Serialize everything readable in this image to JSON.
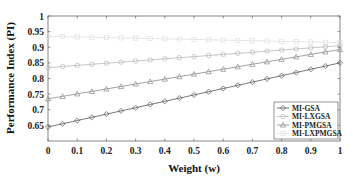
{
  "chart_data": {
    "type": "line",
    "title": "",
    "xlabel": "Weight (w)",
    "ylabel": "Performance Index (PI)",
    "xlim": [
      0,
      1
    ],
    "ylim": [
      0.6,
      1
    ],
    "x_ticks": [
      "0",
      "0.1",
      "0.2",
      "0.3",
      "0.4",
      "0.5",
      "0.6",
      "0.7",
      "0.8",
      "0.9",
      "1"
    ],
    "y_ticks": [
      "0.65",
      "0.7",
      "0.75",
      "0.8",
      "0.85",
      "0.9",
      "0.95",
      "1"
    ],
    "grid": false,
    "legend_position": "lower right",
    "x": [
      0,
      0.05,
      0.1,
      0.15,
      0.2,
      0.25,
      0.3,
      0.35,
      0.4,
      0.45,
      0.5,
      0.55,
      0.6,
      0.65,
      0.7,
      0.75,
      0.8,
      0.85,
      0.9,
      0.95,
      1
    ],
    "series": [
      {
        "name": "MI-GSA",
        "marker": "diamond",
        "color": "#555555",
        "start": 0.645,
        "end": 0.85
      },
      {
        "name": "MI-LXGSA",
        "marker": "circle",
        "color": "#b8b8b8",
        "start": 0.835,
        "end": 0.905
      },
      {
        "name": "MI-PMGSA",
        "marker": "triangle",
        "color": "#8a8a8a",
        "start": 0.735,
        "end": 0.893
      },
      {
        "name": "MI-LXPMGSA",
        "marker": "square",
        "color": "#e0e0e0",
        "start": 0.935,
        "end": 0.915
      }
    ]
  }
}
